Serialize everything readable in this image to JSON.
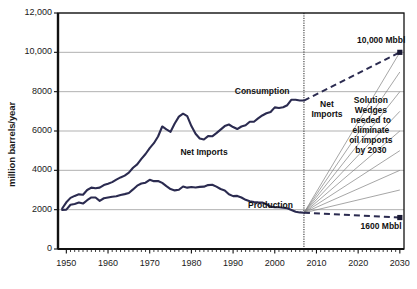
{
  "chart_data": {
    "type": "line",
    "title": "",
    "xlabel": "",
    "ylabel": "million barrels/year",
    "xlim": [
      1948,
      2031
    ],
    "ylim": [
      0,
      12000
    ],
    "grid": true,
    "legend_position": "inline-annotations",
    "ytick_labels": [
      "0",
      "2000",
      "4000",
      "6000",
      "8000",
      "10,000",
      "12,000"
    ],
    "ytick_values": [
      0,
      2000,
      4000,
      6000,
      8000,
      10000,
      12000
    ],
    "xtick_labels": [
      "1950",
      "1960",
      "1970",
      "1980",
      "1990",
      "2000",
      "2010",
      "2020",
      "2030"
    ],
    "xtick_values": [
      1950,
      1960,
      1970,
      1980,
      1990,
      2000,
      2010,
      2020,
      2030
    ],
    "divider_year": 2007,
    "annotations": [
      {
        "name": "consumption-label",
        "text": "Consumption",
        "x": 1997,
        "y": 8050
      },
      {
        "name": "net-imports-label",
        "text": "Net Imports",
        "x": 1983,
        "y": 4950
      },
      {
        "name": "production-label",
        "text": "Production",
        "x": 1999,
        "y": 2250
      },
      {
        "name": "net-imports-future-label",
        "text": "Net\nImports",
        "x": 2012.5,
        "y": 7100
      },
      {
        "name": "solution-wedges-label",
        "text": "Solution\nWedges\nneeded to\neliminate\noil imports\nby 2030",
        "x": 2023,
        "y": 6300
      },
      {
        "name": "upper-endpoint-label",
        "text": "10,000 Mbbl",
        "x": 2025.5,
        "y": 10650
      },
      {
        "name": "lower-endpoint-label",
        "text": "1600 Mbbl",
        "x": 2025.5,
        "y": 1150
      }
    ],
    "series": [
      {
        "name": "Consumption",
        "style": "solid",
        "color": "#2b2b50",
        "x": [
          1949,
          1950,
          1951,
          1952,
          1953,
          1954,
          1955,
          1956,
          1957,
          1958,
          1959,
          1960,
          1961,
          1962,
          1963,
          1964,
          1965,
          1966,
          1967,
          1968,
          1969,
          1970,
          1971,
          1972,
          1973,
          1974,
          1975,
          1976,
          1977,
          1978,
          1979,
          1980,
          1981,
          1982,
          1983,
          1984,
          1985,
          1986,
          1987,
          1988,
          1989,
          1990,
          1991,
          1992,
          1993,
          1994,
          1995,
          1996,
          1997,
          1998,
          1999,
          2000,
          2001,
          2002,
          2003,
          2004,
          2005,
          2006,
          2007
        ],
        "y": [
          2060,
          2375,
          2600,
          2700,
          2780,
          2760,
          3000,
          3120,
          3090,
          3120,
          3250,
          3320,
          3400,
          3530,
          3640,
          3730,
          3880,
          4130,
          4300,
          4580,
          4830,
          5130,
          5380,
          5720,
          6230,
          6080,
          5960,
          6380,
          6730,
          6880,
          6760,
          6250,
          5860,
          5620,
          5570,
          5740,
          5730,
          5890,
          6070,
          6250,
          6330,
          6200,
          6100,
          6230,
          6290,
          6470,
          6470,
          6640,
          6790,
          6900,
          6970,
          7200,
          7170,
          7210,
          7310,
          7590,
          7590,
          7550,
          7550
        ]
      },
      {
        "name": "Production",
        "style": "solid",
        "color": "#2b2b50",
        "x": [
          1949,
          1950,
          1951,
          1952,
          1953,
          1954,
          1955,
          1956,
          1957,
          1958,
          1959,
          1960,
          1961,
          1962,
          1963,
          1964,
          1965,
          1966,
          1967,
          1968,
          1969,
          1970,
          1971,
          1972,
          1973,
          1974,
          1975,
          1976,
          1977,
          1978,
          1979,
          1980,
          1981,
          1982,
          1983,
          1984,
          1985,
          1986,
          1987,
          1988,
          1989,
          1990,
          1991,
          1992,
          1993,
          1994,
          1995,
          1996,
          1997,
          1998,
          1999,
          2000,
          2001,
          2002,
          2003,
          2004,
          2005,
          2006,
          2007
        ],
        "y": [
          1990,
          2000,
          2250,
          2290,
          2360,
          2310,
          2480,
          2620,
          2620,
          2450,
          2580,
          2620,
          2660,
          2680,
          2750,
          2790,
          2850,
          3030,
          3220,
          3330,
          3370,
          3520,
          3450,
          3460,
          3360,
          3200,
          3050,
          2980,
          3010,
          3180,
          3120,
          3150,
          3130,
          3160,
          3170,
          3250,
          3270,
          3170,
          3050,
          2980,
          2780,
          2690,
          2700,
          2620,
          2500,
          2430,
          2390,
          2370,
          2360,
          2280,
          2150,
          2130,
          2120,
          2100,
          2070,
          1980,
          1890,
          1860,
          1840
        ]
      }
    ],
    "projection": [
      {
        "name": "consumption-projection",
        "style": "dashed",
        "color": "#2b2b50",
        "x": [
          2007,
          2030
        ],
        "y": [
          7550,
          10000
        ],
        "endpoint_marker": true
      },
      {
        "name": "production-projection",
        "style": "dashed",
        "color": "#2b2b50",
        "x": [
          2007,
          2030
        ],
        "y": [
          1840,
          1600
        ],
        "endpoint_marker": true
      }
    ],
    "wedges": {
      "name": "solution-wedges",
      "color": "#7a7a7a",
      "origin": {
        "x": 2007,
        "y": 1840
      },
      "endpoints_y": [
        10000,
        9000,
        8000,
        7000,
        6000,
        5000,
        4000,
        3000
      ],
      "endpoint_x": 2030
    }
  },
  "figure": {
    "background": "#ffffff",
    "axis_color": "#111111",
    "grid_color": "#a8a8a8",
    "curve_color": "#2b2b50",
    "wedge_color": "#808080"
  }
}
